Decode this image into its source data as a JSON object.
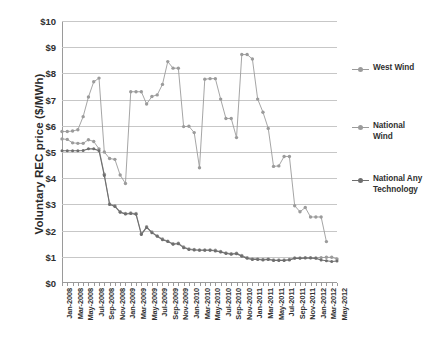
{
  "chart_data": {
    "type": "line",
    "title": "",
    "xlabel": "",
    "ylabel": "Voluntary REC price ($/MWh)",
    "ylim": [
      0,
      10
    ],
    "ytick_labels": [
      "$0",
      "$1",
      "$2",
      "$3",
      "$4",
      "$5",
      "$6",
      "$7",
      "$8",
      "$9",
      "$10"
    ],
    "ytick_values": [
      0,
      1,
      2,
      3,
      4,
      5,
      6,
      7,
      8,
      9,
      10
    ],
    "grid": true,
    "legend_position": "right",
    "legend": [
      "West Wind",
      "National Wind",
      "National Any Technology"
    ],
    "x": [
      "Jan-2008",
      "Feb-2008",
      "Mar-2008",
      "Apr-2008",
      "May-2008",
      "Jun-2008",
      "Jul-2008",
      "Aug-2008",
      "Sep-2008",
      "Oct-2008",
      "Nov-2008",
      "Dec-2008",
      "Jan-2009",
      "Feb-2009",
      "Mar-2009",
      "Apr-2009",
      "May-2009",
      "Jun-2009",
      "Jul-2009",
      "Aug-2009",
      "Sep-2009",
      "Oct-2009",
      "Nov-2009",
      "Dec-2009",
      "Jan-2010",
      "Feb-2010",
      "Mar-2010",
      "Apr-2010",
      "May-2010",
      "Jun-2010",
      "Jul-2010",
      "Aug-2010",
      "Sep-2010",
      "Oct-2010",
      "Nov-2010",
      "Dec-2010",
      "Jan-2011",
      "Feb-2011",
      "Mar-2011",
      "Apr-2011",
      "May-2011",
      "Jun-2011",
      "Jul-2011",
      "Aug-2011",
      "Sep-2011",
      "Oct-2011",
      "Nov-2011",
      "Dec-2011",
      "Jan-2012",
      "Feb-2012",
      "Mar-2012",
      "Apr-2012",
      "May-2012"
    ],
    "xtick_labels": [
      "Jan-2008",
      "Mar-2008",
      "May-2008",
      "Jul-2008",
      "Sep-2008",
      "Nov-2008",
      "Jan-2009",
      "Mar-2009",
      "May-2009",
      "Jul-2009",
      "Sep-2009",
      "Nov-2009",
      "Jan-2010",
      "Mar-2010",
      "May-2010",
      "Jul-2010",
      "Sep-2010",
      "Nov-2010",
      "Jan-2011",
      "Mar-2011",
      "May-2011",
      "Jul-2011",
      "Sep-2011",
      "Nov-2011",
      "Jan-2012",
      "Mar-2012",
      "May-2012"
    ],
    "series": [
      {
        "name": "West Wind",
        "color": "#9b9b9b",
        "values": [
          5.78,
          5.78,
          5.8,
          5.85,
          6.35,
          7.1,
          7.68,
          7.82,
          5.0,
          4.75,
          4.72,
          4.12,
          3.8,
          7.3,
          7.3,
          7.3,
          6.83,
          7.12,
          7.18,
          7.58,
          8.45,
          8.2,
          8.2,
          5.97,
          5.98,
          5.74,
          4.4,
          7.78,
          7.8,
          7.8,
          7.02,
          6.28,
          6.28,
          5.55,
          8.72,
          8.72,
          8.55,
          7.02,
          6.52,
          5.9,
          4.45,
          4.47,
          4.83,
          4.83,
          2.95,
          2.72,
          2.88,
          2.52,
          2.52,
          2.52,
          1.58,
          null,
          null
        ]
      },
      {
        "name": "National Wind",
        "color": "#9b9b9b",
        "values": [
          5.5,
          5.48,
          5.35,
          5.33,
          5.33,
          5.47,
          5.4,
          5.12,
          4.15,
          3.02,
          2.95,
          2.72,
          2.65,
          2.67,
          2.65,
          1.88,
          2.15,
          1.95,
          1.8,
          1.68,
          1.6,
          1.5,
          1.52,
          1.38,
          1.3,
          1.28,
          1.26,
          1.26,
          1.26,
          1.25,
          1.2,
          1.15,
          1.12,
          1.14,
          1.05,
          0.97,
          0.92,
          0.92,
          0.9,
          0.92,
          0.88,
          0.88,
          0.88,
          0.9,
          0.96,
          0.96,
          0.97,
          0.97,
          0.96,
          0.97,
          0.98,
          0.98,
          0.92
        ]
      },
      {
        "name": "National Any Technology",
        "color": "#6e6e6e",
        "values": [
          5.05,
          5.05,
          5.05,
          5.05,
          5.06,
          5.12,
          5.12,
          5.05,
          4.1,
          3.0,
          2.92,
          2.7,
          2.63,
          2.65,
          2.62,
          1.85,
          2.12,
          1.92,
          1.78,
          1.65,
          1.58,
          1.48,
          1.5,
          1.35,
          1.28,
          1.26,
          1.25,
          1.25,
          1.25,
          1.22,
          1.18,
          1.13,
          1.1,
          1.12,
          1.02,
          0.94,
          0.9,
          0.9,
          0.88,
          0.9,
          0.86,
          0.86,
          0.86,
          0.88,
          0.94,
          0.94,
          0.95,
          0.95,
          0.94,
          0.88,
          0.85,
          0.82,
          0.84
        ]
      }
    ]
  },
  "legend": {
    "items": [
      {
        "label": "West Wind"
      },
      {
        "label": "National Wind"
      },
      {
        "label": "National Any Technology"
      }
    ]
  }
}
